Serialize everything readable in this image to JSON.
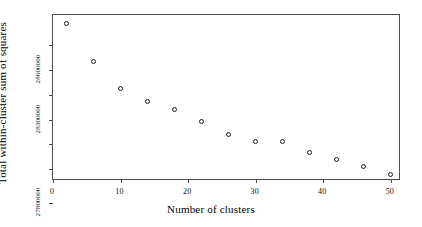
{
  "chart_data": {
    "type": "scatter",
    "title": "",
    "xlabel": "Number of clusters",
    "ylabel": "Total within-cluster sum of squares",
    "x": [
      2,
      6,
      10,
      14,
      18,
      22,
      26,
      30,
      34,
      38,
      42,
      46,
      50
    ],
    "values": [
      28880000,
      28650000,
      28490000,
      28410000,
      28360000,
      28290000,
      28210000,
      28170000,
      28170000,
      28100000,
      28060000,
      28020000,
      27970000
    ],
    "series": [
      {
        "name": "Total within-cluster sum of squares",
        "values": [
          28880000,
          28650000,
          28490000,
          28410000,
          28360000,
          28290000,
          28210000,
          28170000,
          28170000,
          28100000,
          28060000,
          28020000,
          27970000
        ]
      }
    ],
    "xlim": [
      0,
      51.5
    ],
    "ylim": [
      27930000,
      28930000
    ],
    "xticks": [
      0,
      10,
      20,
      30,
      40,
      50
    ],
    "xticklabels": [
      "0",
      "10",
      "20",
      "30",
      "40",
      "50"
    ],
    "yticks": [
      28600000,
      28300000,
      27800000
    ],
    "yticklabels": [
      "28600000",
      "28300000",
      "27800000"
    ],
    "yticks_minor": [
      28750000,
      28450000,
      28150000,
      28000000
    ],
    "grid": false,
    "legend": null,
    "marker": "open-circle",
    "marker_color": "#1a1a1a",
    "frame_color": "#4d4d4d",
    "background": "#ffffff"
  }
}
